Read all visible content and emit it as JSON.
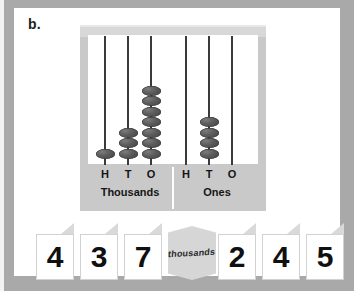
{
  "worksheet": {
    "item_label": "b.",
    "background_color": "#a9a9a9",
    "page_color": "#ffffff"
  },
  "abacus": {
    "bead_color": "#4a4a4a",
    "frame_color": "#c9c9c9",
    "groups": [
      {
        "name": "Thousands",
        "columns": [
          {
            "letter": "H",
            "beads": 1
          },
          {
            "letter": "T",
            "beads": 3
          },
          {
            "letter": "O",
            "beads": 7
          }
        ]
      },
      {
        "name": "Ones",
        "columns": [
          {
            "letter": "H",
            "beads": 0
          },
          {
            "letter": "T",
            "beads": 4
          },
          {
            "letter": "O",
            "beads": 0
          }
        ]
      }
    ]
  },
  "number_cards": [
    {
      "type": "digit",
      "value": "4"
    },
    {
      "type": "digit",
      "value": "3"
    },
    {
      "type": "digit",
      "value": "7"
    },
    {
      "type": "label",
      "value": "thousands"
    },
    {
      "type": "digit",
      "value": "2"
    },
    {
      "type": "digit",
      "value": "4"
    },
    {
      "type": "digit",
      "value": "5"
    }
  ]
}
